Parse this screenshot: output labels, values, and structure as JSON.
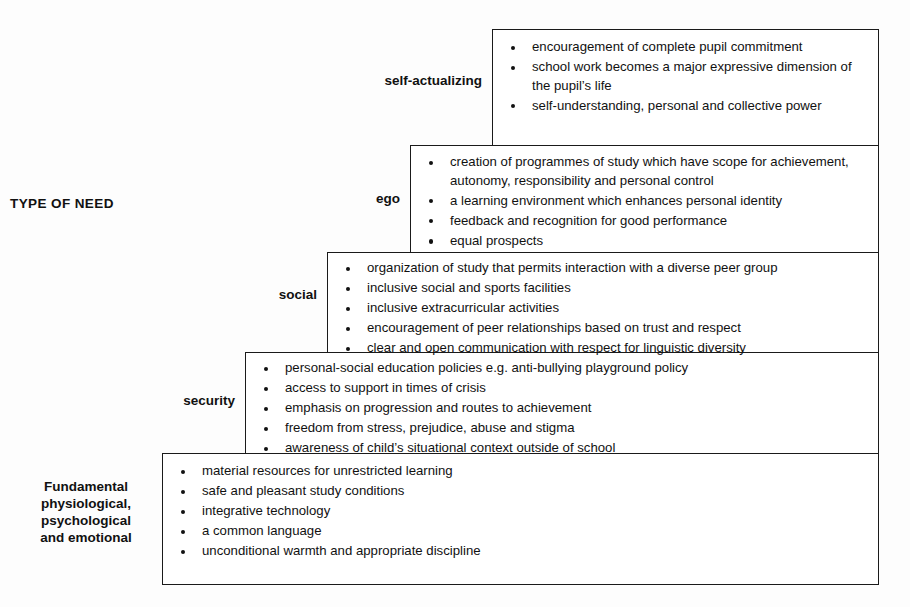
{
  "figure": {
    "axis_label": "TYPE OF NEED"
  },
  "tiers": [
    {
      "id": "self-actualizing",
      "label": "self-actualizing",
      "items": [
        "encouragement of complete pupil commitment",
        "school work becomes a major expressive dimension of the pupil’s life",
        "self-understanding, personal and collective power"
      ]
    },
    {
      "id": "ego",
      "label": "ego",
      "items": [
        "creation of programmes of study which have scope for achievement, autonomy, responsibility and personal control",
        "a learning environment which enhances personal identity",
        "feedback and recognition for good performance",
        "equal prospects"
      ]
    },
    {
      "id": "social",
      "label": "social",
      "items": [
        "organization of study that permits interaction with a diverse peer group",
        "inclusive social and sports facilities",
        "inclusive extracurricular activities",
        "encouragement of peer relationships based on trust and respect",
        "clear and open communication with respect for linguistic diversity"
      ]
    },
    {
      "id": "security",
      "label": "security",
      "items": [
        "personal-social education policies e.g. anti-bullying playground policy",
        "access to support in times of crisis",
        "emphasis on progression and routes to achievement",
        "freedom from stress, prejudice, abuse and stigma",
        "awareness of child’s situational context outside of school"
      ]
    },
    {
      "id": "fundamental",
      "label": "Fundamental physiological, psychological and emotional",
      "label_lines": [
        "Fundamental",
        "physiological,",
        "psychological",
        "and emotional"
      ],
      "items": [
        "material resources for unrestricted learning",
        "safe and pleasant study conditions",
        "integrative technology",
        "a common language",
        "unconditional warmth and appropriate discipline"
      ]
    }
  ],
  "style": {
    "page_background": "#fdfdfd",
    "box_background": "#ffffff",
    "border_color": "#1a1a1a",
    "text_color": "#111111"
  }
}
